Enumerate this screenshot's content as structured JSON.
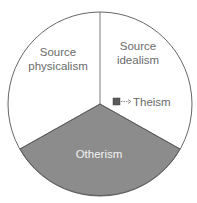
{
  "diagram": {
    "type": "pie",
    "segments": [
      {
        "id": "source-physicalism",
        "label_lines": [
          "Source",
          "physicalism"
        ],
        "fill": "#ffffff"
      },
      {
        "id": "source-idealism",
        "label_lines": [
          "Source",
          "idealism"
        ],
        "fill": "#ffffff"
      },
      {
        "id": "otherism",
        "label_lines": [
          "Otherism"
        ],
        "fill": "#8c8c8c"
      }
    ],
    "annotation": {
      "label": "Theism",
      "arrow": "→",
      "marker_fill": "#5a5a5a"
    },
    "colors": {
      "outline": "#555555",
      "text": "#6a6a6a",
      "shaded": "#8c8c8c",
      "shaded_text": "#f2f2f2"
    }
  }
}
